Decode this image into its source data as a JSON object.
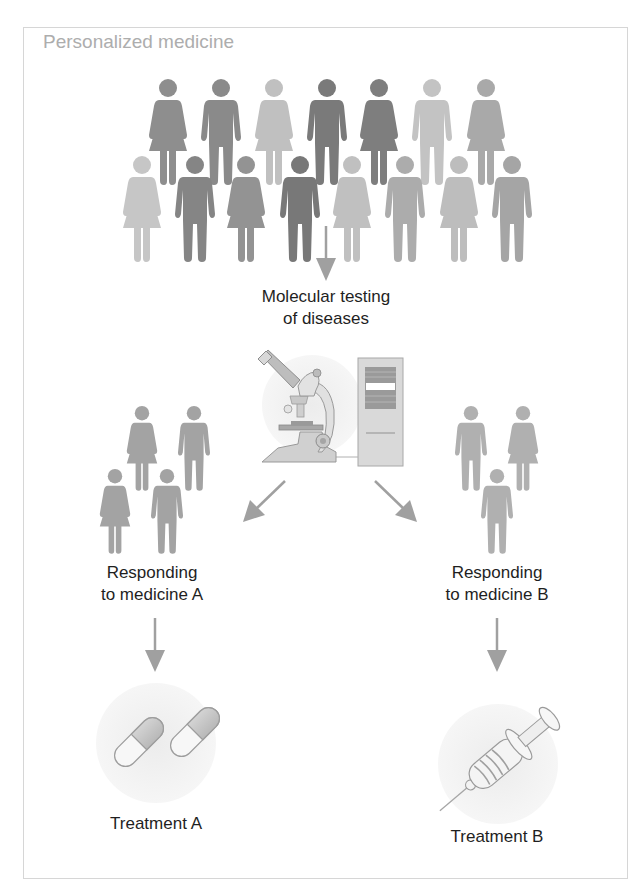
{
  "diagram": {
    "title": "Personalized medicine",
    "steps": {
      "testing": {
        "line1": "Molecular testing",
        "line2": "of diseases",
        "icon": "microscope-and-computer-icon"
      },
      "group_a": {
        "line1": "Responding",
        "line2": "to medicine A",
        "count": 4
      },
      "group_b": {
        "line1": "Responding",
        "line2": "to medicine B",
        "count": 3
      }
    },
    "treatments": [
      {
        "label": "Treatment A",
        "icon": "capsule-pills-icon"
      },
      {
        "label": "Treatment B",
        "icon": "syringe-icon"
      }
    ],
    "population": {
      "top_row": [
        {
          "sex": "female",
          "shade": "#8e8e8e"
        },
        {
          "sex": "male",
          "shade": "#8a8a8a"
        },
        {
          "sex": "female",
          "shade": "#c0c0c0"
        },
        {
          "sex": "male",
          "shade": "#7a7a7a"
        },
        {
          "sex": "female",
          "shade": "#7e7e7e"
        },
        {
          "sex": "male",
          "shade": "#c3c3c3"
        },
        {
          "sex": "female",
          "shade": "#a9a9a9"
        }
      ],
      "bottom_row": [
        {
          "sex": "female",
          "shade": "#c6c6c6"
        },
        {
          "sex": "male",
          "shade": "#858585"
        },
        {
          "sex": "female",
          "shade": "#939393"
        },
        {
          "sex": "male",
          "shade": "#787878"
        },
        {
          "sex": "female",
          "shade": "#c0c0c0"
        },
        {
          "sex": "male",
          "shade": "#acacac"
        },
        {
          "sex": "female",
          "shade": "#bdbdbd"
        },
        {
          "sex": "male",
          "shade": "#a5a5a5"
        }
      ]
    },
    "colors": {
      "arrow": "#a0a0a0",
      "group_figure": "#a3a3a3",
      "title": "#adadad",
      "text": "#1f1f1f",
      "border": "#d6d6d6"
    },
    "caption_visible": false
  }
}
